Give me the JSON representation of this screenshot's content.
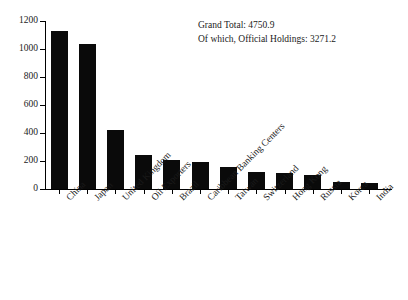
{
  "chart_data": {
    "type": "bar",
    "title": "",
    "xlabel": "",
    "ylabel": "",
    "ylim": [
      0,
      1200
    ],
    "yticks": [
      0,
      200,
      400,
      600,
      800,
      1000,
      1200
    ],
    "grid": false,
    "legend": null,
    "bar_color": "#0a0a0a",
    "categories": [
      "China",
      "Japan",
      "United Kingdom",
      "Oil Exporters",
      "Brazil",
      "Caribbean Banking Centers",
      "Taiwan",
      "Switzerland",
      "Hong Kong",
      "Russia",
      "Korea",
      "India"
    ],
    "values": [
      1130,
      1035,
      425,
      243,
      208,
      192,
      155,
      123,
      113,
      98,
      52,
      42
    ],
    "annotations": [
      "Grand Total: 4750.9",
      "Of which, Official Holdings: 3271.2"
    ]
  }
}
